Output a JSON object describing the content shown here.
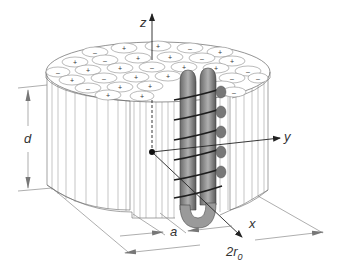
{
  "diagram": {
    "type": "3d-technical-illustration",
    "axes": {
      "z_label": "z",
      "y_label": "y",
      "x_label": "x"
    },
    "dimensions": {
      "height_label": "d",
      "spacing_label": "a",
      "diameter_label": "2r",
      "diameter_subscript": "0"
    },
    "rod_marks": [
      "+",
      "-"
    ],
    "colors": {
      "line": "#555555",
      "coil_fill": "#8a8a8a",
      "coil_dark": "#333333",
      "arrow": "#222222",
      "background": "#ffffff"
    }
  }
}
